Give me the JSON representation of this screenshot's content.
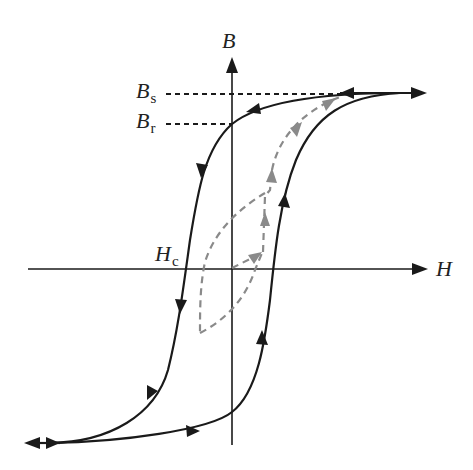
{
  "diagram": {
    "type": "magnetic hysteresis loop",
    "axes": {
      "x_label": "H",
      "y_label": "B"
    },
    "labels": {
      "saturation": {
        "main": "B",
        "sub": "s"
      },
      "remanence": {
        "main": "B",
        "sub": "r"
      },
      "coercivity": {
        "main": "H",
        "sub": "c"
      }
    },
    "colors": {
      "loop": "#1a1a1a",
      "axes": "#1a1a1a",
      "initial_curve": "#8a8a8a",
      "guide_lines": "#1a1a1a"
    },
    "elements": [
      "major hysteresis loop (solid black, with direction arrows)",
      "initial magnetization curve and minor loop (gray dashed, with arrows)",
      "dashed guide lines from B axis to Bs and Br levels"
    ]
  }
}
